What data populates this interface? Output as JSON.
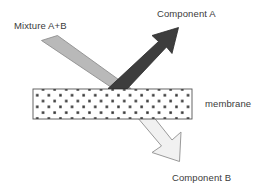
{
  "diagram": {
    "labels": {
      "mixture": "Mixture A+B",
      "component_a": "Component A",
      "membrane": "membrane",
      "component_b": "Component B"
    },
    "colors": {
      "background": "#ffffff",
      "feed_arrow_fill": "#b9b9b9",
      "feed_arrow_stroke": "#8f8f8f",
      "retentate_arrow_fill": "#3d3d3d",
      "retentate_arrow_stroke": "#2b2b2b",
      "permeate_arrow_fill": "#f1f1f1",
      "permeate_arrow_stroke": "#9a9a9a",
      "membrane_fill": "#ffffff",
      "membrane_stroke": "#555555",
      "membrane_dot": "#2e2e2e",
      "text": "#3b3b3b"
    },
    "membrane_band": {
      "x": 33,
      "y": 89,
      "width": 159,
      "height": 30,
      "pattern": "staggered-dot-grid"
    },
    "arrows": [
      {
        "name": "feed-arrow",
        "role": "incoming mixture A+B",
        "direction": "down-right",
        "style": "blunt-ended band",
        "shade": "medium-gray"
      },
      {
        "name": "retentate-arrow",
        "role": "Component A rejected at membrane surface",
        "direction": "up-right",
        "style": "solid arrow with head",
        "shade": "dark"
      },
      {
        "name": "permeate-arrow",
        "role": "Component B passing through membrane",
        "direction": "down-right",
        "style": "outlined arrow with head",
        "shade": "very-light"
      }
    ]
  }
}
